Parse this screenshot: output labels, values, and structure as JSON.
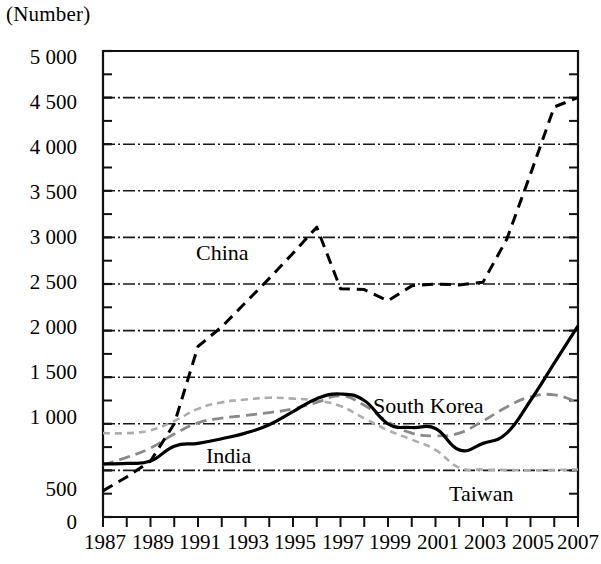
{
  "chart_data": {
    "type": "line",
    "title": "",
    "subtitle": "",
    "xlabel": "",
    "ylabel": "(Number)",
    "unit_label": "(Number)",
    "xlim": [
      1987,
      2007
    ],
    "ylim": [
      0,
      5000
    ],
    "ytick_step": 500,
    "yminor_step": 250,
    "grid": "horizontal dash-dot gridlines at every 500",
    "legend": "inline labels next to series",
    "x": [
      1987,
      1988,
      1989,
      1990,
      1991,
      1992,
      1993,
      1994,
      1995,
      1996,
      1997,
      1998,
      1999,
      2000,
      2001,
      2002,
      2003,
      2004,
      2005,
      2006,
      2007
    ],
    "xticks": [
      1987,
      1988,
      1989,
      1990,
      1991,
      1992,
      1993,
      1994,
      1995,
      1996,
      1997,
      1998,
      1999,
      2000,
      2001,
      2002,
      2003,
      2004,
      2005,
      2006,
      2007
    ],
    "xtick_labels": [
      "1987",
      "1989",
      "1991",
      "1993",
      "1995",
      "1997",
      "1999",
      "2001",
      "2003",
      "2005",
      "2007"
    ],
    "xtick_labeled_years": [
      1987,
      1989,
      1991,
      1993,
      1995,
      1997,
      1999,
      2001,
      2003,
      2005,
      2007
    ],
    "ytick_labels": [
      "0",
      "500",
      "1 000",
      "1 500",
      "2 000",
      "2 500",
      "3 000",
      "3 500",
      "4 000",
      "4 500",
      "5 000"
    ],
    "ytick_values": [
      0,
      500,
      1000,
      1500,
      2000,
      2500,
      3000,
      3500,
      4000,
      4500,
      5000
    ],
    "series": [
      {
        "name": "China",
        "style": "dashed-black",
        "color": "#000000",
        "label": "China",
        "values": [
          280,
          430,
          600,
          1000,
          1830,
          2040,
          2300,
          2560,
          2830,
          3110,
          2450,
          2440,
          2320,
          2480,
          2500,
          2490,
          2520,
          2980,
          3680,
          4400,
          4500
        ]
      },
      {
        "name": "India",
        "style": "solid-black",
        "color": "#000000",
        "label": "India",
        "values": [
          570,
          575,
          600,
          760,
          790,
          840,
          900,
          990,
          1130,
          1270,
          1320,
          1250,
          1000,
          960,
          950,
          720,
          790,
          900,
          1250,
          1650,
          2050
        ]
      },
      {
        "name": "South Korea",
        "style": "dashed-gray",
        "color": "#8a8a8a",
        "label": "South Korea",
        "values": [
          560,
          640,
          740,
          890,
          1010,
          1060,
          1090,
          1120,
          1160,
          1230,
          1300,
          1200,
          1020,
          900,
          870,
          900,
          1030,
          1180,
          1290,
          1310,
          1230
        ]
      },
      {
        "name": "Taiwan",
        "style": "dotted-lightgray",
        "color": "#b0b0b0",
        "label": "Taiwan",
        "values": [
          900,
          900,
          930,
          1030,
          1160,
          1230,
          1260,
          1280,
          1270,
          1250,
          1190,
          1060,
          930,
          830,
          720,
          530,
          510,
          505,
          500,
          505,
          510
        ]
      }
    ]
  },
  "labels": {
    "china": "China",
    "india": "India",
    "south_korea": "South Korea",
    "taiwan": "Taiwan",
    "unit": "(Number)"
  },
  "yticks": [
    {
      "label": "5 000"
    },
    {
      "label": "4 500"
    },
    {
      "label": "4 000"
    },
    {
      "label": "3 500"
    },
    {
      "label": "3 000"
    },
    {
      "label": "2 500"
    },
    {
      "label": "2 000"
    },
    {
      "label": "1 500"
    },
    {
      "label": "1 000"
    },
    {
      "label": "500"
    },
    {
      "label": "0"
    }
  ],
  "xticks": [
    {
      "label": "1987"
    },
    {
      "label": "1989"
    },
    {
      "label": "1991"
    },
    {
      "label": "1993"
    },
    {
      "label": "1995"
    },
    {
      "label": "1997"
    },
    {
      "label": "1999"
    },
    {
      "label": "2001"
    },
    {
      "label": "2003"
    },
    {
      "label": "2005"
    },
    {
      "label": "2007"
    }
  ]
}
